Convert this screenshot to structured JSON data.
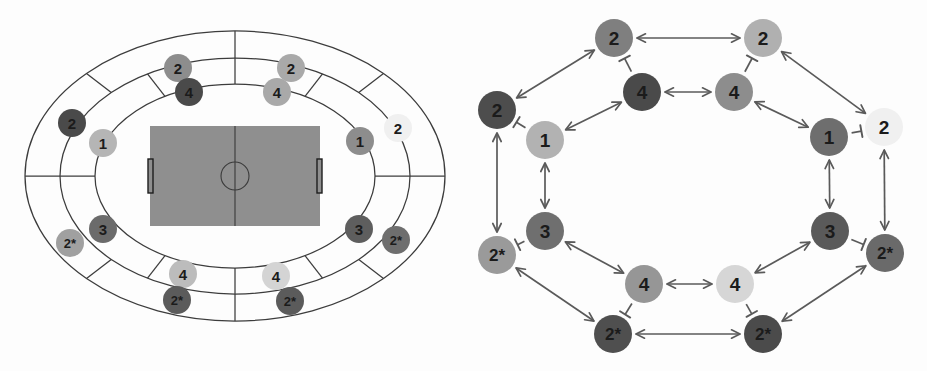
{
  "figure": {
    "panels": [
      {
        "id": "stadium",
        "name": "stadium-zone-map"
      },
      {
        "id": "network",
        "name": "interaction-network"
      }
    ]
  },
  "palette": {
    "very_dark": "#4a4a4a",
    "dark": "#5e5e5e",
    "medium_dark": "#7a7a7a",
    "medium": "#8d8d8d",
    "light": "#a9a9a9",
    "very_light": "#c4c4c4",
    "pale": "#ededed",
    "pitch": "#8f8f8f",
    "line": "#3c3c3c",
    "edge": "#5a5a5a",
    "text": "#1b1b1b",
    "background": "#fdfdfd"
  },
  "stadium": {
    "name": "stadium-zone-map",
    "pitch": {
      "name": "football-pitch",
      "fill": "#8f8f8f",
      "x": 150,
      "y": 126,
      "width": 170,
      "height": 100,
      "center_circle_r": 14,
      "goal_width": 5,
      "goal_height": 34
    },
    "rings": [
      {
        "name": "ring-outer",
        "rx": 210,
        "ry": 145
      },
      {
        "name": "ring-middle",
        "rx": 175,
        "ry": 118
      },
      {
        "name": "ring-inner",
        "rx": 140,
        "ry": 92
      }
    ],
    "center": {
      "cx": 235,
      "cy": 176
    },
    "nodes": [
      {
        "id": "s1",
        "label": "2",
        "cx": 178,
        "cy": 68,
        "r": 14,
        "color": "#8d8d8d",
        "tone": "medium"
      },
      {
        "id": "s2",
        "label": "4",
        "cx": 189,
        "cy": 92,
        "r": 14,
        "color": "#4a4a4a",
        "tone": "very_dark"
      },
      {
        "id": "s3",
        "label": "2",
        "cx": 291,
        "cy": 68,
        "r": 14,
        "color": "#a9a9a9",
        "tone": "light"
      },
      {
        "id": "s4",
        "label": "4",
        "cx": 277,
        "cy": 92,
        "r": 14,
        "color": "#a9a9a9",
        "tone": "light"
      },
      {
        "id": "s5",
        "label": "2",
        "cx": 72,
        "cy": 123,
        "r": 14,
        "color": "#4a4a4a",
        "tone": "very_dark"
      },
      {
        "id": "s6",
        "label": "1",
        "cx": 103,
        "cy": 143,
        "r": 14,
        "color": "#b5b5b5",
        "tone": "very_light"
      },
      {
        "id": "s7",
        "label": "1",
        "cx": 360,
        "cy": 141,
        "r": 14,
        "color": "#8d8d8d",
        "tone": "medium"
      },
      {
        "id": "s8",
        "label": "2",
        "cx": 398,
        "cy": 128,
        "r": 14,
        "color": "#f0f0f0",
        "tone": "pale"
      },
      {
        "id": "s9",
        "label": "3",
        "cx": 103,
        "cy": 229,
        "r": 14,
        "color": "#6b6b6b",
        "tone": "dark"
      },
      {
        "id": "s10",
        "label": "2*",
        "cx": 70,
        "cy": 243,
        "r": 14,
        "color": "#a0a0a0",
        "tone": "light"
      },
      {
        "id": "s11",
        "label": "3",
        "cx": 359,
        "cy": 229,
        "r": 14,
        "color": "#5e5e5e",
        "tone": "dark"
      },
      {
        "id": "s12",
        "label": "2*",
        "cx": 396,
        "cy": 240,
        "r": 14,
        "color": "#6e6e6e",
        "tone": "medium_dark"
      },
      {
        "id": "s13",
        "label": "4",
        "cx": 183,
        "cy": 274,
        "r": 14,
        "color": "#bcbcbc",
        "tone": "very_light"
      },
      {
        "id": "s14",
        "label": "2*",
        "cx": 177,
        "cy": 300,
        "r": 14,
        "color": "#5b5b5b",
        "tone": "dark"
      },
      {
        "id": "s15",
        "label": "4",
        "cx": 276,
        "cy": 276,
        "r": 14,
        "color": "#d4d4d4",
        "tone": "pale"
      },
      {
        "id": "s16",
        "label": "2*",
        "cx": 290,
        "cy": 301,
        "r": 14,
        "color": "#5b5b5b",
        "tone": "dark"
      }
    ]
  },
  "network": {
    "name": "interaction-network",
    "nodes": [
      {
        "id": "n1",
        "label": "2",
        "cx": 150,
        "cy": 38,
        "r": 19,
        "color": "#7f7f7f",
        "tone": "medium"
      },
      {
        "id": "n2",
        "label": "2",
        "cx": 299,
        "cy": 38,
        "r": 19,
        "color": "#b0b0b0",
        "tone": "light"
      },
      {
        "id": "n3",
        "label": "4",
        "cx": 178,
        "cy": 92,
        "r": 19,
        "color": "#4a4a4a",
        "tone": "very_dark"
      },
      {
        "id": "n4",
        "label": "4",
        "cx": 270,
        "cy": 92,
        "r": 19,
        "color": "#8d8d8d",
        "tone": "medium"
      },
      {
        "id": "n5",
        "label": "2",
        "cx": 33,
        "cy": 110,
        "r": 19,
        "color": "#4d4d4d",
        "tone": "very_dark"
      },
      {
        "id": "n6",
        "label": "1",
        "cx": 81,
        "cy": 140,
        "r": 19,
        "color": "#b2b2b2",
        "tone": "light"
      },
      {
        "id": "n7",
        "label": "1",
        "cx": 365,
        "cy": 137,
        "r": 19,
        "color": "#6e6e6e",
        "tone": "medium_dark"
      },
      {
        "id": "n8",
        "label": "2",
        "cx": 420,
        "cy": 127,
        "r": 19,
        "color": "#f0f0f0",
        "tone": "pale"
      },
      {
        "id": "n9",
        "label": "3",
        "cx": 81,
        "cy": 231,
        "r": 19,
        "color": "#6f6f6f",
        "tone": "medium_dark"
      },
      {
        "id": "n10",
        "label": "2*",
        "cx": 33,
        "cy": 255,
        "r": 19,
        "color": "#9a9a9a",
        "tone": "light"
      },
      {
        "id": "n11",
        "label": "3",
        "cx": 366,
        "cy": 231,
        "r": 19,
        "color": "#5a5a5a",
        "tone": "dark"
      },
      {
        "id": "n12",
        "label": "2*",
        "cx": 421,
        "cy": 253,
        "r": 19,
        "color": "#6a6a6a",
        "tone": "medium_dark"
      },
      {
        "id": "n13",
        "label": "4",
        "cx": 180,
        "cy": 284,
        "r": 19,
        "color": "#969696",
        "tone": "medium"
      },
      {
        "id": "n14",
        "label": "4",
        "cx": 271,
        "cy": 284,
        "r": 19,
        "color": "#d6d6d6",
        "tone": "pale"
      },
      {
        "id": "n15",
        "label": "2*",
        "cx": 149,
        "cy": 334,
        "r": 19,
        "color": "#4f4f4f",
        "tone": "very_dark"
      },
      {
        "id": "n16",
        "label": "2*",
        "cx": 299,
        "cy": 334,
        "r": 19,
        "color": "#4b4b4b",
        "tone": "very_dark"
      }
    ],
    "edges": [
      {
        "from": "n1",
        "to": "n2",
        "type": "double-arrow"
      },
      {
        "from": "n5",
        "to": "n1",
        "type": "double-arrow"
      },
      {
        "from": "n2",
        "to": "n8",
        "type": "double-arrow"
      },
      {
        "from": "n3",
        "to": "n4",
        "type": "double-arrow"
      },
      {
        "from": "n6",
        "to": "n3",
        "type": "double-arrow"
      },
      {
        "from": "n4",
        "to": "n7",
        "type": "double-arrow"
      },
      {
        "from": "n3",
        "to": "n1",
        "type": "t-bar"
      },
      {
        "from": "n4",
        "to": "n2",
        "type": "t-bar"
      },
      {
        "from": "n6",
        "to": "n5",
        "type": "t-bar"
      },
      {
        "from": "n7",
        "to": "n8",
        "type": "t-bar"
      },
      {
        "from": "n9",
        "to": "n6",
        "type": "double-arrow"
      },
      {
        "from": "n11",
        "to": "n7",
        "type": "double-arrow"
      },
      {
        "from": "n10",
        "to": "n5",
        "type": "double-arrow"
      },
      {
        "from": "n12",
        "to": "n8",
        "type": "double-arrow"
      },
      {
        "from": "n9",
        "to": "n10",
        "type": "t-bar"
      },
      {
        "from": "n11",
        "to": "n12",
        "type": "t-bar"
      },
      {
        "from": "n9",
        "to": "n13",
        "type": "double-arrow"
      },
      {
        "from": "n11",
        "to": "n14",
        "type": "double-arrow"
      },
      {
        "from": "n10",
        "to": "n15",
        "type": "double-arrow"
      },
      {
        "from": "n12",
        "to": "n16",
        "type": "double-arrow"
      },
      {
        "from": "n13",
        "to": "n14",
        "type": "double-arrow"
      },
      {
        "from": "n15",
        "to": "n16",
        "type": "double-arrow"
      },
      {
        "from": "n13",
        "to": "n15",
        "type": "t-bar"
      },
      {
        "from": "n14",
        "to": "n16",
        "type": "t-bar"
      }
    ]
  }
}
